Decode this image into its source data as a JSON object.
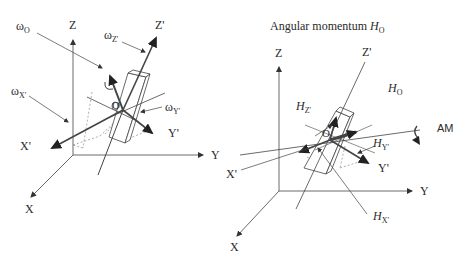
{
  "figure": {
    "left_panel": {
      "name": "angular-velocity-diagram",
      "labels": {
        "omega_o": {
          "symbol": "ω",
          "sub": "O"
        },
        "omega_z": {
          "symbol": "ω",
          "sub": "Z'"
        },
        "omega_x": {
          "symbol": "ω",
          "sub": "X'"
        },
        "omega_y": {
          "symbol": "ω",
          "sub": "Y'"
        },
        "origin": "O",
        "axis_z": "Z",
        "axis_y": "Y",
        "axis_x": "X",
        "axis_z_prime": "Z'",
        "axis_y_prime": "Y'",
        "axis_x_prime": "X'"
      }
    },
    "right_panel": {
      "name": "angular-momentum-diagram",
      "title": {
        "text": "Angular momentum ",
        "symbol": "H",
        "sub": "O"
      },
      "labels": {
        "h_o": {
          "symbol": "H",
          "sub": "O"
        },
        "h_z": {
          "symbol": "H",
          "sub": "Z'"
        },
        "h_y": {
          "symbol": "H",
          "sub": "Y'"
        },
        "h_x": {
          "symbol": "H",
          "sub": "X'"
        },
        "am": "AM",
        "origin": "O",
        "axis_z": "Z",
        "axis_y": "Y",
        "axis_x": "X",
        "axis_z_prime": "Z'",
        "axis_y_prime": "Y'",
        "axis_x_prime": "X'"
      }
    },
    "colors": {
      "line": "#333333",
      "thin": "#555555",
      "dashed": "#777777",
      "background": "#ffffff"
    }
  }
}
